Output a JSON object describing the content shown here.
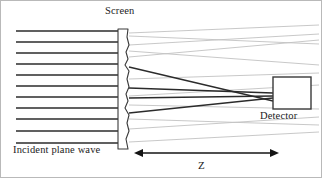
{
  "figure": {
    "width": 322,
    "height": 178,
    "background": "#ffffff",
    "border_color": "#b9b9b9"
  },
  "labels": {
    "screen": "Screen",
    "detector": "Detector",
    "incident": "Incident plane wave",
    "distance": "Z"
  },
  "colors": {
    "ink": "#1b1b1b",
    "ray_dark": "#2b2b2b",
    "ray_faint": "#c2c2c2",
    "outline": "#3a3a3a"
  },
  "chart_data": {
    "type": "diagram",
    "elements": {
      "screen": {
        "label": "Screen",
        "x_left": 117,
        "x_right": 128,
        "y_top": 28,
        "y_bottom": 148,
        "right_edge": "wavy",
        "stroke": "#3a3a3a"
      },
      "detector": {
        "label": "Detector",
        "x_left": 272,
        "x_right": 310,
        "y_top": 76,
        "y_bottom": 108,
        "stroke": "#3a3a3a"
      },
      "distance_arrow": {
        "label": "Z",
        "x_start": 133,
        "x_end": 278,
        "y": 152,
        "double_headed": true
      }
    },
    "plane_wave_lines": {
      "count": 11,
      "x_start": 15,
      "x_end": 118,
      "y_values": [
        30,
        41,
        52,
        63,
        74,
        85,
        96,
        107,
        118,
        130,
        142
      ],
      "stroke": "#2b2b2b",
      "width": 1.4
    },
    "dark_rays": [
      {
        "x1": 128,
        "y1": 66,
        "x2": 272,
        "y2": 100
      },
      {
        "x1": 128,
        "y1": 87,
        "x2": 272,
        "y2": 92
      },
      {
        "x1": 128,
        "y1": 97,
        "x2": 272,
        "y2": 95
      },
      {
        "x1": 128,
        "y1": 112,
        "x2": 272,
        "y2": 97
      }
    ],
    "faint_rays": [
      {
        "x1": 128,
        "y1": 32,
        "x2": 318,
        "y2": 24
      },
      {
        "x1": 128,
        "y1": 44,
        "x2": 318,
        "y2": 33
      },
      {
        "x1": 128,
        "y1": 56,
        "x2": 318,
        "y2": 39
      },
      {
        "x1": 128,
        "y1": 50,
        "x2": 318,
        "y2": 64
      },
      {
        "x1": 128,
        "y1": 35,
        "x2": 318,
        "y2": 43
      },
      {
        "x1": 128,
        "y1": 78,
        "x2": 318,
        "y2": 72
      },
      {
        "x1": 128,
        "y1": 104,
        "x2": 318,
        "y2": 108
      },
      {
        "x1": 128,
        "y1": 118,
        "x2": 318,
        "y2": 124
      },
      {
        "x1": 128,
        "y1": 128,
        "x2": 318,
        "y2": 116
      },
      {
        "x1": 128,
        "y1": 141,
        "x2": 318,
        "y2": 131
      },
      {
        "x1": 128,
        "y1": 95,
        "x2": 318,
        "y2": 84
      }
    ]
  }
}
